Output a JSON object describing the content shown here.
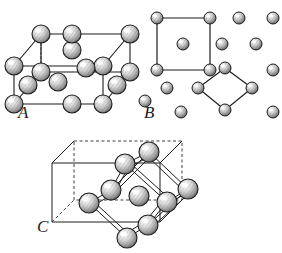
{
  "figure": {
    "background_color": "#ffffff",
    "ink_color": "#1a1a1a",
    "atom_fill": "#cfcfcf",
    "atom_highlight": "#ffffff",
    "atom_shadow": "#4a4a4a",
    "width": 282,
    "height": 253
  },
  "panels": [
    {
      "id": "A",
      "label": "A",
      "label_x": 18,
      "label_y": 104,
      "type": "body-centered-cubic-with-face-atoms",
      "description": "Cube drawn in oblique projection with atoms at the eight corners, atoms at edge midpoints and a central atom.",
      "cube": {
        "front_top_left": [
          14,
          66
        ],
        "front_top_right": [
          103,
          66
        ],
        "front_bottom_left": [
          14,
          104
        ],
        "front_bottom_right": [
          103,
          104
        ],
        "back_offset": [
          27,
          -32
        ]
      },
      "atoms": [
        {
          "id": "A1",
          "x": 14,
          "y": 66,
          "r": 9,
          "role": "corner-front-top-left"
        },
        {
          "id": "A2",
          "x": 103,
          "y": 66,
          "r": 9,
          "role": "corner-front-top-right"
        },
        {
          "id": "A3",
          "x": 14,
          "y": 104,
          "r": 9,
          "role": "corner-front-bottom-left"
        },
        {
          "id": "A4",
          "x": 103,
          "y": 104,
          "r": 9,
          "role": "corner-front-bottom-right"
        },
        {
          "id": "A5",
          "x": 41,
          "y": 34,
          "r": 9,
          "role": "corner-back-top-left"
        },
        {
          "id": "A6",
          "x": 130,
          "y": 34,
          "r": 9,
          "role": "corner-back-top-right"
        },
        {
          "id": "A7",
          "x": 41,
          "y": 72,
          "r": 9,
          "role": "corner-back-bottom-left"
        },
        {
          "id": "A8",
          "x": 130,
          "y": 72,
          "r": 9,
          "role": "corner-back-bottom-right"
        },
        {
          "id": "A9",
          "x": 72,
          "y": 50,
          "r": 9,
          "role": "face-top-center"
        },
        {
          "id": "A10",
          "x": 72,
          "y": 88,
          "r": 9,
          "role": "face-bottom-center"
        },
        {
          "id": "A11",
          "x": 28,
          "y": 85,
          "r": 9,
          "role": "face-left-center"
        },
        {
          "id": "A12",
          "x": 117,
          "y": 85,
          "r": 9,
          "role": "face-right-center"
        },
        {
          "id": "A13",
          "x": 86,
          "y": 68,
          "r": 9,
          "role": "face-back-center"
        },
        {
          "id": "A14",
          "x": 58,
          "y": 82,
          "r": 9,
          "role": "body-center"
        }
      ]
    },
    {
      "id": "B",
      "label": "B",
      "label_x": 144,
      "label_y": 104,
      "type": "planar-lattice-projection",
      "description": "Projected lattice of atoms with one square unit outlined at upper left containing a centred atom, and one diamond (rotated square) unit outlined at lower right.",
      "square_outline": {
        "points": [
          [
            157,
            18
          ],
          [
            210,
            18
          ],
          [
            210,
            70
          ],
          [
            157,
            70
          ]
        ],
        "center_atom": [
          183,
          44
        ]
      },
      "diamond_outline": {
        "points": [
          [
            225,
            68
          ],
          [
            252,
            88
          ],
          [
            225,
            110
          ],
          [
            198,
            88
          ]
        ]
      },
      "atoms": [
        {
          "id": "B1",
          "x": 157,
          "y": 18,
          "r": 6,
          "role": "square-corner"
        },
        {
          "id": "B2",
          "x": 210,
          "y": 18,
          "r": 6,
          "role": "square-corner"
        },
        {
          "id": "B3",
          "x": 157,
          "y": 70,
          "r": 6,
          "role": "square-corner"
        },
        {
          "id": "B4",
          "x": 210,
          "y": 70,
          "r": 6,
          "role": "square-corner"
        },
        {
          "id": "B5",
          "x": 183,
          "y": 44,
          "r": 6,
          "role": "square-center"
        },
        {
          "id": "B6",
          "x": 239,
          "y": 18,
          "r": 6,
          "role": "lattice"
        },
        {
          "id": "B7",
          "x": 273,
          "y": 18,
          "r": 6,
          "role": "lattice"
        },
        {
          "id": "B8",
          "x": 222,
          "y": 44,
          "r": 6,
          "role": "lattice"
        },
        {
          "id": "B9",
          "x": 256,
          "y": 44,
          "r": 6,
          "role": "lattice"
        },
        {
          "id": "B10",
          "x": 273,
          "y": 70,
          "r": 6,
          "role": "lattice"
        },
        {
          "id": "B11",
          "x": 167,
          "y": 88,
          "r": 6,
          "role": "lattice"
        },
        {
          "id": "B12",
          "x": 145,
          "y": 101,
          "r": 6,
          "role": "lattice"
        },
        {
          "id": "B13",
          "x": 181,
          "y": 112,
          "r": 6,
          "role": "lattice"
        },
        {
          "id": "B14",
          "x": 225,
          "y": 68,
          "r": 6,
          "role": "diamond-top"
        },
        {
          "id": "B15",
          "x": 198,
          "y": 88,
          "r": 6,
          "role": "diamond-left"
        },
        {
          "id": "B16",
          "x": 252,
          "y": 88,
          "r": 6,
          "role": "diamond-right"
        },
        {
          "id": "B17",
          "x": 225,
          "y": 110,
          "r": 6,
          "role": "diamond-bottom"
        },
        {
          "id": "B18",
          "x": 273,
          "y": 112,
          "r": 6,
          "role": "lattice"
        }
      ]
    },
    {
      "id": "C",
      "label": "C",
      "label_x": 37,
      "label_y": 235,
      "type": "octahedral-cluster-in-cube",
      "description": "Outline cube in oblique projection containing a bonded octahedral/cuboid cluster of eight atoms plus one central atom, bonds drawn as double lines.",
      "cube": {
        "front_bottom_left": [
          52,
          222
        ],
        "front_bottom_right": [
          160,
          222
        ],
        "front_top_left": [
          52,
          163
        ],
        "front_top_right": [
          160,
          163
        ],
        "back_offset": [
          22,
          -22
        ]
      },
      "cluster_atoms": [
        {
          "id": "C1",
          "x": 149,
          "y": 152,
          "r": 10,
          "role": "cluster-top-back"
        },
        {
          "id": "C2",
          "x": 125,
          "y": 164,
          "r": 10,
          "role": "cluster-top-front"
        },
        {
          "id": "C3",
          "x": 188,
          "y": 189,
          "r": 10,
          "role": "cluster-right-back"
        },
        {
          "id": "C4",
          "x": 167,
          "y": 202,
          "r": 10,
          "role": "cluster-right-front"
        },
        {
          "id": "C5",
          "x": 111,
          "y": 190,
          "r": 10,
          "role": "cluster-left-back"
        },
        {
          "id": "C6",
          "x": 89,
          "y": 203,
          "r": 10,
          "role": "cluster-left-front"
        },
        {
          "id": "C7",
          "x": 148,
          "y": 225,
          "r": 10,
          "role": "cluster-bottom-back"
        },
        {
          "id": "C8",
          "x": 127,
          "y": 238,
          "r": 10,
          "role": "cluster-bottom-front"
        },
        {
          "id": "C9",
          "x": 139,
          "y": 196,
          "r": 10,
          "role": "cluster-center"
        }
      ],
      "bonds": [
        [
          "C2",
          "C1"
        ],
        [
          "C1",
          "C3"
        ],
        [
          "C3",
          "C4"
        ],
        [
          "C4",
          "C2"
        ],
        [
          "C2",
          "C5"
        ],
        [
          "C5",
          "C6"
        ],
        [
          "C6",
          "C8"
        ],
        [
          "C8",
          "C7"
        ],
        [
          "C7",
          "C4"
        ],
        [
          "C5",
          "C1"
        ],
        [
          "C6",
          "C2"
        ],
        [
          "C7",
          "C3"
        ]
      ]
    }
  ]
}
